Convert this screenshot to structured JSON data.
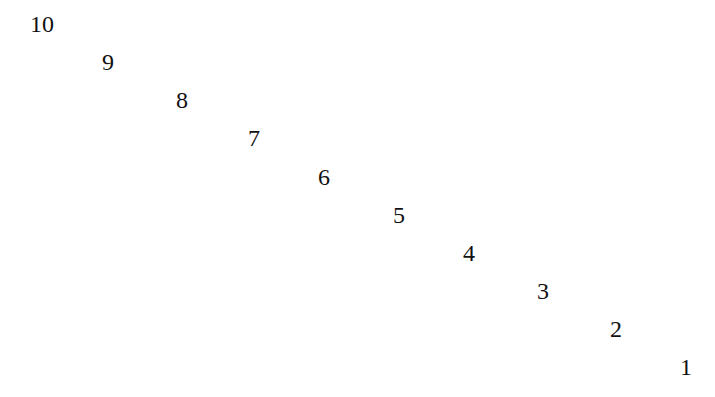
{
  "numbers": [
    {
      "label": "10",
      "x": 30,
      "y": 12
    },
    {
      "label": "9",
      "x": 102,
      "y": 50
    },
    {
      "label": "8",
      "x": 176,
      "y": 88
    },
    {
      "label": "7",
      "x": 248,
      "y": 126
    },
    {
      "label": "6",
      "x": 318,
      "y": 165
    },
    {
      "label": "5",
      "x": 393,
      "y": 203
    },
    {
      "label": "4",
      "x": 463,
      "y": 241
    },
    {
      "label": "3",
      "x": 537,
      "y": 279
    },
    {
      "label": "2",
      "x": 610,
      "y": 317
    },
    {
      "label": "1",
      "x": 680,
      "y": 355
    }
  ]
}
